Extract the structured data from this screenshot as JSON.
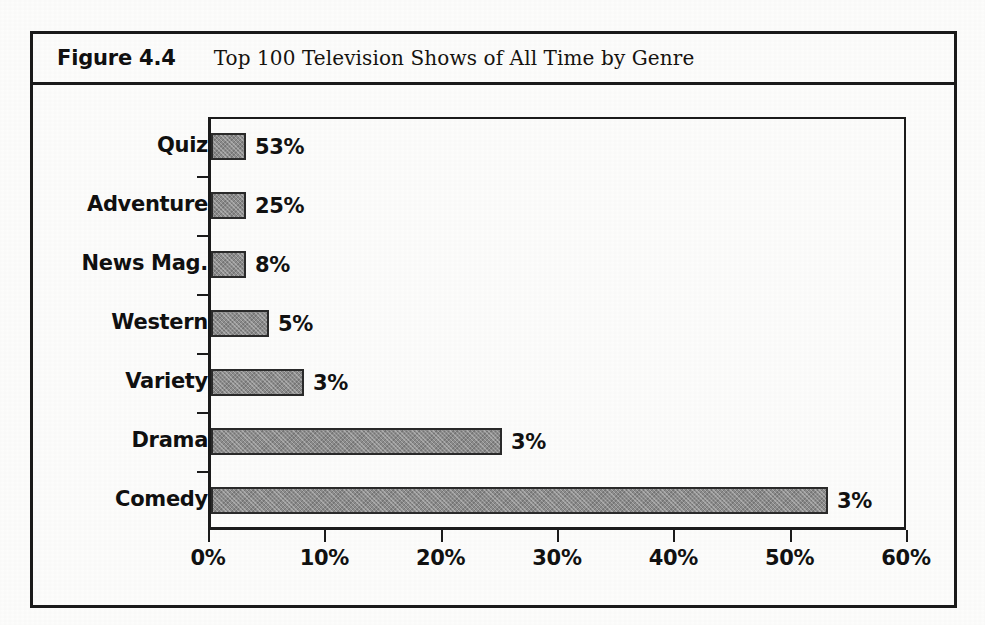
{
  "figure": {
    "number_label": "Figure 4.4",
    "title": "Top 100 Television Shows of All Time by Genre"
  },
  "chart_data": {
    "type": "bar",
    "orientation": "horizontal",
    "title": "Top 100 Television Shows of All Time by Genre",
    "xlabel": "",
    "ylabel": "",
    "categories": [
      "Comedy",
      "Drama",
      "Variety",
      "Western",
      "News Mag.",
      "Adventure",
      "Quiz"
    ],
    "values": [
      53,
      25,
      8,
      5,
      3,
      3,
      3
    ],
    "value_labels": [
      "53%",
      "25%",
      "8%",
      "5%",
      "3%",
      "3%",
      "3%"
    ],
    "categories_top_to_bottom": [
      "Quiz",
      "Adventure",
      "News Mag.",
      "Western",
      "Variety",
      "Drama",
      "Comedy"
    ],
    "values_top_to_bottom": [
      3,
      3,
      3,
      5,
      8,
      25,
      53
    ],
    "xlim": [
      0,
      60
    ],
    "xtick_values": [
      0,
      10,
      20,
      30,
      40,
      50,
      60
    ],
    "xtick_labels": [
      "0%",
      "10%",
      "20%",
      "30%",
      "40%",
      "50%",
      "60%"
    ],
    "grid": false,
    "legend": false,
    "bar_fill_color": "#8b8b8b",
    "bar_edge_color": "#2a2a2a",
    "axis_color": "#1b1b1b",
    "background_color": "#ffffff"
  }
}
